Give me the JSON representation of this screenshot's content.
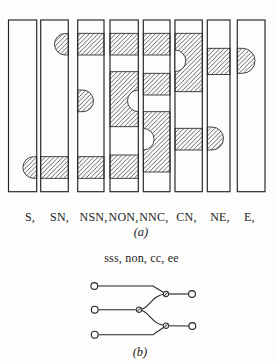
{
  "panel_a": {
    "caption": "(a)",
    "bar_top": 20,
    "bar_h": 171.7,
    "label_y": 220.5,
    "hatch_color": "#242424",
    "bars": [
      {
        "label": "S,",
        "x": 8.5,
        "w": 28.2,
        "label_cx": 30,
        "features": [
          {
            "type": "tongue",
            "x1": 22.9,
            "x2": 36.7,
            "y1": 156.7,
            "y2": 178.3,
            "cap": "left"
          }
        ]
      },
      {
        "label": "SN,",
        "x": 40.7,
        "w": 27.6,
        "label_cx": 59.5,
        "features": [
          {
            "type": "tongue",
            "x1": 54.5,
            "x2": 68.3,
            "y1": 33.5,
            "y2": 55,
            "cap": "left"
          },
          {
            "type": "band",
            "y1": 156.7,
            "y2": 178.3
          }
        ]
      },
      {
        "label": "NSN,",
        "x": 77.7,
        "w": 26.3,
        "label_cx": 93.5,
        "features": [
          {
            "type": "band",
            "y1": 33.3,
            "y2": 55
          },
          {
            "type": "tongue",
            "x1": 77.7,
            "x2": 93.5,
            "y1": 90,
            "y2": 111.7,
            "cap": "right"
          },
          {
            "type": "band",
            "y1": 156.7,
            "y2": 178.3
          }
        ]
      },
      {
        "label": "NON,",
        "x": 110,
        "w": 28.3,
        "label_cx": 123.5,
        "features": [
          {
            "type": "band",
            "y1": 33.3,
            "y2": 55
          },
          {
            "type": "block",
            "y1": 71.7,
            "y2": 126.7,
            "notch": {
              "side": "right",
              "cy": 100.8,
              "r": 10.8
            }
          },
          {
            "type": "band",
            "y1": 155,
            "y2": 178.3
          }
        ]
      },
      {
        "label": "NNC,",
        "x": 143.3,
        "w": 26.7,
        "label_cx": 153.8,
        "features": [
          {
            "type": "band",
            "y1": 33.3,
            "y2": 55
          },
          {
            "type": "band",
            "y1": 73.3,
            "y2": 95
          },
          {
            "type": "block",
            "y1": 111.7,
            "y2": 172,
            "notch": {
              "side": "left",
              "cy": 139.2,
              "r": 10.8
            }
          }
        ]
      },
      {
        "label": "CN,",
        "x": 175,
        "w": 27.3,
        "label_cx": 186.5,
        "features": [
          {
            "type": "block",
            "y1": 33.3,
            "y2": 91.7,
            "notch": {
              "side": "left",
              "cy": 60.8,
              "r": 10.8
            }
          },
          {
            "type": "band",
            "y1": 128.3,
            "y2": 150
          }
        ]
      },
      {
        "label": "NE,",
        "x": 207.3,
        "w": 22.7,
        "label_cx": 220,
        "features": [
          {
            "type": "band",
            "y1": 48.3,
            "y2": 74.5
          },
          {
            "type": "tongue",
            "x1": 207.3,
            "x2": 223.5,
            "y1": 127,
            "y2": 150,
            "cap": "right"
          }
        ]
      },
      {
        "label": "E,",
        "x": 237.3,
        "w": 27.7,
        "label_cx": 249.3,
        "features": [
          {
            "type": "tongue",
            "x1": 237.3,
            "x2": 255,
            "y1": 48.3,
            "y2": 73.3,
            "cap": "right"
          }
        ]
      }
    ]
  },
  "panel_b": {
    "subtitle": "sss, non, cc, ee",
    "caption": "(b)",
    "leaf_r": 3.4,
    "junction_r": 2.8,
    "leaves": [
      {
        "cx": 94.3,
        "cy": 286
      },
      {
        "cx": 94.7,
        "cy": 309.7
      },
      {
        "cx": 94.7,
        "cy": 334.7
      },
      {
        "cx": 192,
        "cy": 294
      },
      {
        "cx": 192.3,
        "cy": 326
      }
    ],
    "junctions": [
      {
        "cx": 166,
        "cy": 294
      },
      {
        "cx": 139,
        "cy": 309.7
      },
      {
        "cx": 166,
        "cy": 325.7
      }
    ],
    "edges": [
      "M97.8 286 L153 286 L166 294",
      "M98.2 309.7 L139 309.7",
      "M98.2 334.7 L153 334.7 L166 325.7",
      "M139 309.7 C149 309.7 151.5 294.5 166 294",
      "M139 309.7 C149 309.7 151.5 325.2 166 325.7",
      "M166 294 L188.5 294",
      "M166 325.7 L188.8 326"
    ]
  }
}
